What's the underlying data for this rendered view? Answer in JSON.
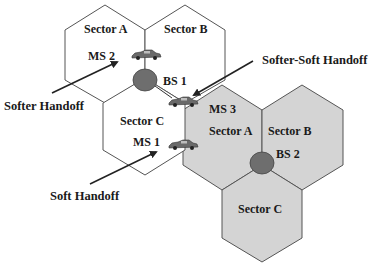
{
  "diagram": {
    "colors": {
      "background": "#ffffff",
      "cell_outline": "#555555",
      "shaded_cell_fill": "#d4d4d4",
      "base_station_fill": "#6e6e6e",
      "text": "#1a1a1a",
      "arrow": "#222222"
    },
    "cell1": {
      "base_station": "BS 1",
      "sectors": [
        "Sector A",
        "Sector B",
        "Sector C"
      ]
    },
    "cell2": {
      "base_station": "BS 2",
      "sectors": [
        "Sector A",
        "Sector B",
        "Sector C"
      ]
    },
    "mobiles": [
      {
        "label": "MS 2",
        "location": "BS 1 Sector A / Sector B boundary"
      },
      {
        "label": "MS 3",
        "location": "BS 1 Sector C / BS 2 Sector A boundary"
      },
      {
        "label": "MS 1",
        "location": "BS 1 Sector C / BS 2 Sector A boundary"
      }
    ],
    "annotations": {
      "softer": "Softer Handoff",
      "softer_soft": "Softer-Soft Handoff",
      "soft": "Soft Handoff"
    }
  }
}
